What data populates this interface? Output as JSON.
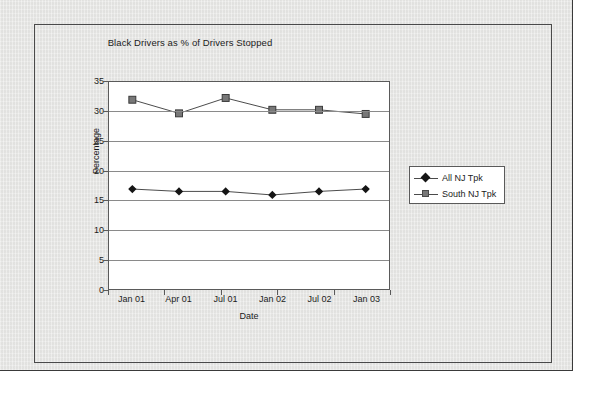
{
  "chart_data": {
    "type": "line",
    "title": "Black Drivers as % of Drivers Stopped",
    "xlabel": "Date",
    "ylabel": "Percentage",
    "categories": [
      "Jan 01",
      "Apr 01",
      "Jul 01",
      "Jan 02",
      "Jul 02",
      "Jan 03"
    ],
    "ylim": [
      0,
      35
    ],
    "yticks": [
      0,
      5,
      10,
      15,
      20,
      25,
      30,
      35
    ],
    "ytick_labels": [
      "0",
      "5",
      "10",
      "15",
      "20",
      "25",
      "30",
      "35"
    ],
    "grid": "horizontal",
    "legend_position": "right",
    "series": [
      {
        "name": "All NJ Tpk",
        "marker": "diamond",
        "color": "#151515",
        "values": [
          16.9,
          16.5,
          16.5,
          15.9,
          16.5,
          16.9
        ]
      },
      {
        "name": "South NJ Tpk",
        "marker": "square",
        "color": "#787878",
        "values": [
          32.0,
          29.7,
          32.3,
          30.3,
          30.3,
          29.6
        ]
      }
    ]
  },
  "colors": {
    "page_background": "#e7e7e5",
    "plot_background": "#ffffff",
    "frame": "#4a4a4a",
    "gridline": "#8a8a8a",
    "text": "#1b1b1b"
  }
}
